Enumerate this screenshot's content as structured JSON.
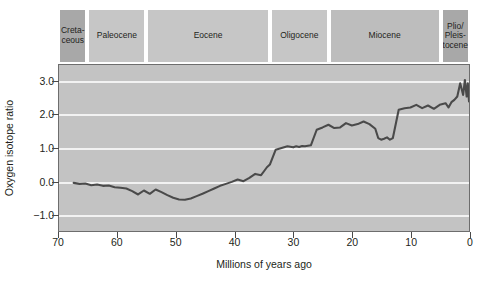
{
  "chart_data": {
    "type": "line",
    "title": "",
    "xlabel": "Millions of years ago",
    "ylabel": "Oxygen isotope ratio",
    "xlim": [
      70,
      0
    ],
    "ylim": [
      3.5,
      -1.5
    ],
    "x_ticks": [
      70,
      60,
      50,
      40,
      30,
      20,
      10,
      0
    ],
    "y_ticks": [
      "-1.0",
      "0.0",
      "1.0",
      "2.0",
      "3.0"
    ],
    "y_tick_values": [
      -1.0,
      0.0,
      1.0,
      2.0,
      3.0
    ],
    "y_axis_inverted": true,
    "x_axis_reversed": true,
    "grid": true,
    "grid_color": "#f2f2f2",
    "plot_background": "#c3c3c3",
    "line_color": "#4a4a4a",
    "legend": "none",
    "series": [
      {
        "name": "Oxygen isotope ratio",
        "x": [
          67.5,
          66.5,
          65.5,
          64.5,
          63.5,
          62.5,
          61.5,
          60.5,
          59.5,
          58.5,
          57.5,
          56.5,
          55.5,
          54.5,
          53.5,
          52.5,
          51.5,
          50.5,
          49.5,
          48.5,
          47.5,
          46.5,
          45.5,
          44.5,
          43.5,
          42.5,
          41.5,
          40.5,
          39.5,
          38.5,
          37.5,
          36.5,
          35.5,
          35.0,
          34.5,
          34.0,
          33.0,
          32.0,
          31.0,
          30.0,
          29.5,
          29.0,
          28.5,
          28.0,
          27.0,
          26.0,
          25.0,
          24.0,
          23.0,
          22.0,
          21.0,
          20.0,
          19.0,
          18.0,
          17.0,
          16.0,
          15.5,
          15.0,
          14.5,
          14.0,
          13.5,
          13.0,
          12.0,
          11.0,
          10.0,
          9.0,
          8.0,
          7.0,
          6.0,
          5.0,
          4.0,
          3.5,
          3.0,
          2.5,
          2.0,
          1.5,
          1.0,
          0.7,
          0.4,
          0.2,
          0.0
        ],
        "y": [
          -0.05,
          -0.08,
          -0.07,
          -0.12,
          -0.1,
          -0.14,
          -0.13,
          -0.18,
          -0.2,
          -0.22,
          -0.3,
          -0.4,
          -0.28,
          -0.38,
          -0.25,
          -0.33,
          -0.42,
          -0.5,
          -0.55,
          -0.56,
          -0.52,
          -0.45,
          -0.38,
          -0.3,
          -0.22,
          -0.14,
          -0.08,
          -0.02,
          0.05,
          0.0,
          0.1,
          0.22,
          0.18,
          0.3,
          0.42,
          0.5,
          0.95,
          1.0,
          1.05,
          1.02,
          1.05,
          1.03,
          1.06,
          1.05,
          1.08,
          1.55,
          1.62,
          1.7,
          1.6,
          1.62,
          1.75,
          1.68,
          1.72,
          1.8,
          1.72,
          1.58,
          1.3,
          1.25,
          1.28,
          1.32,
          1.25,
          1.3,
          2.15,
          2.2,
          2.22,
          2.3,
          2.2,
          2.28,
          2.18,
          2.3,
          2.35,
          2.22,
          2.38,
          2.45,
          2.55,
          2.95,
          2.6,
          3.05,
          2.55,
          2.95,
          2.4
        ]
      }
    ],
    "epochs": [
      {
        "name": "Creta-\nceous",
        "line1": "Creta-",
        "line2": "ceous",
        "start": 70,
        "end": 65,
        "shade": "dark"
      },
      {
        "name": "Paleocene",
        "line1": "Paleocene",
        "line2": "",
        "start": 65,
        "end": 55,
        "shade": "light"
      },
      {
        "name": "Eocene",
        "line1": "Eocene",
        "line2": "",
        "start": 55,
        "end": 34,
        "shade": "light"
      },
      {
        "name": "Oligocene",
        "line1": "Oligocene",
        "line2": "",
        "start": 34,
        "end": 24,
        "shade": "light"
      },
      {
        "name": "Miocene",
        "line1": "Miocene",
        "line2": "",
        "start": 24,
        "end": 5,
        "shade": "medium"
      },
      {
        "name": "Plio/\nPleis-\ntocene",
        "line1": "Plio/",
        "line2": "Pleis-",
        "line3": "tocene",
        "start": 5,
        "end": 0,
        "shade": "dark"
      }
    ],
    "epoch_shades": {
      "light": "#c6c6c6",
      "medium": "#bdbdbd",
      "dark": "#a8a8a8"
    }
  }
}
